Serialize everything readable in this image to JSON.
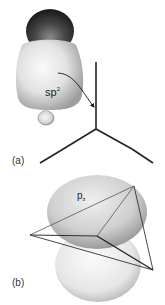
{
  "figure": {
    "panels": [
      {
        "id": "a",
        "label": "(a)",
        "orbital": {
          "name": "sp",
          "superscript": "2"
        },
        "description": "sp2 hybrid orbital (large lobe with dark cap and small back lobe) pointing to one bond of a trigonal planar framework"
      },
      {
        "id": "b",
        "label": "(b)",
        "orbital": {
          "name": "p",
          "subscript": "z"
        },
        "description": "p_z orbital (two lobes) perpendicular to trigonal planar sp2 framework"
      }
    ],
    "colors": {
      "lobe_light": "#e8e8e8",
      "lobe_shadow": "#a8a8a8",
      "cap_dark": "#3a3a3a",
      "lines": "#222222"
    }
  }
}
